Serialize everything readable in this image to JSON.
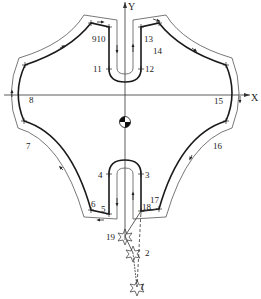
{
  "diagram": {
    "axes": {
      "x_label": "X",
      "y_label": "Y"
    },
    "colors": {
      "contour": "#1a1a1a",
      "offset_path": "#555555",
      "axis": "#333333",
      "background": "#ffffff"
    },
    "points": [
      {
        "id": "1",
        "label": "1",
        "x": 137,
        "y": 287
      },
      {
        "id": "2",
        "label": "2",
        "x": 133,
        "y": 253
      },
      {
        "id": "19",
        "label": "19",
        "x": 125,
        "y": 236
      },
      {
        "id": "18",
        "label": "18",
        "x": 141,
        "y": 211
      },
      {
        "id": "17",
        "label": "17",
        "x": 159,
        "y": 209
      },
      {
        "id": "3",
        "label": "3",
        "x": 141,
        "y": 174
      },
      {
        "id": "4",
        "label": "4",
        "x": 109,
        "y": 174
      },
      {
        "id": "5",
        "label": "5",
        "x": 109,
        "y": 214
      },
      {
        "id": "6",
        "label": "6",
        "x": 91,
        "y": 210
      },
      {
        "id": "7",
        "label": "7",
        "x": 24,
        "y": 121
      },
      {
        "id": "8",
        "label": "8",
        "x": 25,
        "y": 65
      },
      {
        "id": "9",
        "label": "9",
        "x": 91,
        "y": 23
      },
      {
        "id": "10",
        "label": "10",
        "x": 109,
        "y": 27
      },
      {
        "id": "11",
        "label": "11",
        "x": 109,
        "y": 69
      },
      {
        "id": "12",
        "label": "12",
        "x": 141,
        "y": 69
      },
      {
        "id": "13",
        "label": "13",
        "x": 141,
        "y": 27
      },
      {
        "id": "14",
        "label": "14",
        "x": 159,
        "y": 23
      },
      {
        "id": "15",
        "label": "15",
        "x": 226,
        "y": 65
      },
      {
        "id": "16",
        "label": "16",
        "x": 226,
        "y": 121
      }
    ],
    "labels": {
      "p1": "1",
      "p2": "2",
      "p3": "3",
      "p4": "4",
      "p5": "5",
      "p6": "6",
      "p7": "7",
      "p8": "8",
      "p910": "910",
      "p11": "11",
      "p12": "12",
      "p13": "13",
      "p14": "14",
      "p15": "15",
      "p16": "16",
      "p17": "17",
      "p18": "18",
      "p19": "19"
    },
    "origin_symbol": "workpiece-zero-icon"
  }
}
